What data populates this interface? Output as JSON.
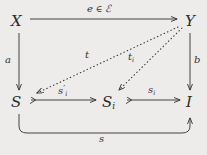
{
  "diagram": {
    "kind": "commutative-diagram",
    "background_color": "#edecea",
    "ink_color": "#34322f",
    "nodes": [
      {
        "id": "X",
        "label": "X",
        "x": 16,
        "y": 22
      },
      {
        "id": "Y",
        "label": "Y",
        "x": 190,
        "y": 22
      },
      {
        "id": "S",
        "label": "S",
        "x": 16,
        "y": 103
      },
      {
        "id": "Si",
        "label": "S",
        "sub": "i",
        "x": 108,
        "y": 103
      },
      {
        "id": "I",
        "label": "I",
        "x": 190,
        "y": 103
      }
    ],
    "edges": [
      {
        "id": "e",
        "from": "X",
        "to": "Y",
        "style": "solid",
        "head": "standard",
        "tail": "none",
        "label": "e",
        "label_op": " ∈ ",
        "label_set": "ℰ",
        "label_x": 103,
        "label_y": 12
      },
      {
        "id": "a",
        "from": "X",
        "to": "S",
        "style": "solid",
        "head": "standard",
        "tail": "none",
        "label": "a",
        "label_x": 8,
        "label_y": 60
      },
      {
        "id": "b",
        "from": "Y",
        "to": "I",
        "style": "solid",
        "head": "standard",
        "tail": "none",
        "label": "b",
        "label_x": 193,
        "label_y": 60
      },
      {
        "id": "t",
        "from": "Y",
        "to": "S",
        "style": "dotted",
        "head": "standard",
        "tail": "none",
        "label": "t",
        "label_x": 87,
        "label_y": 55
      },
      {
        "id": "ti",
        "from": "Y",
        "to": "Si",
        "style": "dotted",
        "head": "standard",
        "tail": "none",
        "label": "t",
        "sub": "i",
        "label_x": 130,
        "label_y": 57
      },
      {
        "id": "s-prime-i",
        "from": "S",
        "to": "Si",
        "style": "solid",
        "head": "standard",
        "tail": "hook-mono",
        "label": "s",
        "sub": "i",
        "prime": "′",
        "label_x": 62,
        "label_y": 91
      },
      {
        "id": "si",
        "from": "Si",
        "to": "I",
        "style": "solid",
        "head": "standard",
        "tail": "hook-mono",
        "label": "s",
        "sub": "i",
        "label_x": 152,
        "label_y": 91
      },
      {
        "id": "s",
        "from": "S",
        "to": "I",
        "style": "solid-curved",
        "head": "standard",
        "tail": "none",
        "label": "s",
        "label_x": 101,
        "label_y": 139
      }
    ]
  }
}
